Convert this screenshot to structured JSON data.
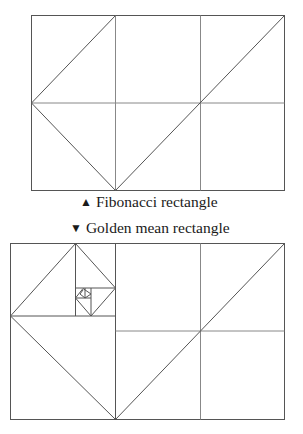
{
  "figures": [
    {
      "name": "fibonacci-rectangle",
      "caption": {
        "marker": "▲",
        "text": "Fibonacci rectangle"
      },
      "stroke_color": "#555555"
    },
    {
      "name": "golden-mean-rectangle",
      "caption": {
        "marker": "▼",
        "text": "Golden mean rectangle"
      },
      "stroke_color": "#555555"
    }
  ]
}
